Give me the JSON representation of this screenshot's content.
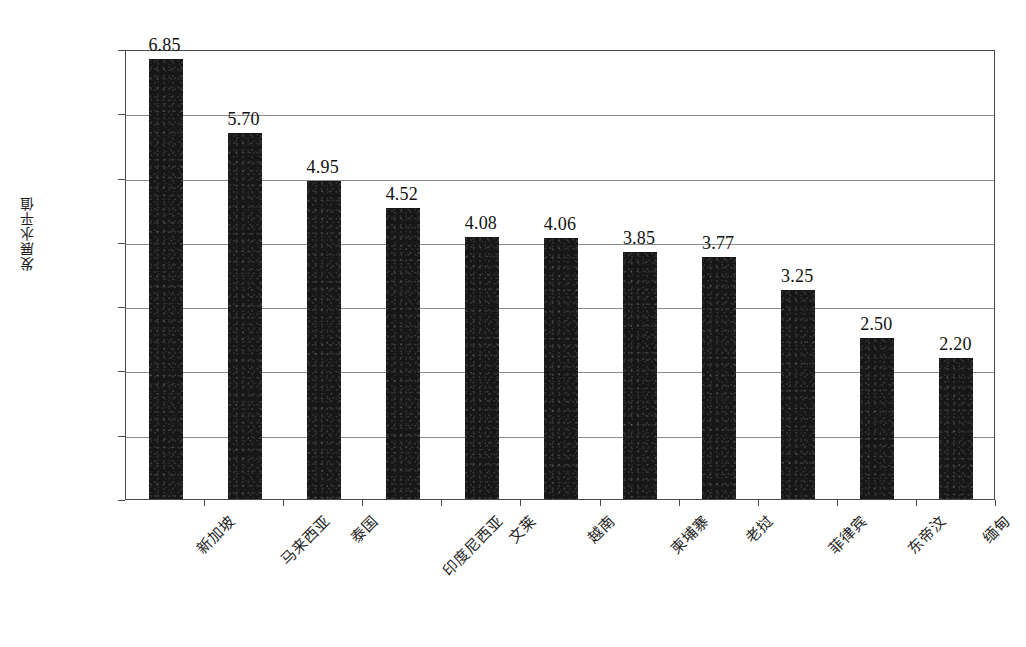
{
  "chart_data": {
    "type": "bar",
    "title": "",
    "subtitle": "",
    "xlabel": "",
    "ylabel": "发展水平值",
    "ylim": [
      0,
      7
    ],
    "ytick_labels": [
      "7.00",
      "6.00",
      "5.00",
      "4.00",
      "3.00",
      "2.00",
      "1.00",
      "0"
    ],
    "ytick_values": [
      7,
      6,
      5,
      4,
      3,
      2,
      1,
      0
    ],
    "grid": "horizontal",
    "legend": "none",
    "orientation": "vertical",
    "categories": [
      "新加坡",
      "马来西亚",
      "泰国",
      "印度尼西亚",
      "文莱",
      "越南",
      "柬埔寨",
      "老挝",
      "菲律宾",
      "东帝汶",
      "缅甸"
    ],
    "values": [
      6.85,
      5.7,
      4.95,
      4.52,
      4.08,
      4.06,
      3.85,
      3.77,
      3.25,
      2.5,
      2.2
    ],
    "data_labels": [
      "6.85",
      "5.70",
      "4.95",
      "4.52",
      "4.08",
      "4.06",
      "3.85",
      "3.77",
      "3.25",
      "2.50",
      "2.20"
    ],
    "series": [
      {
        "name": "发展水平值",
        "values": [
          6.85,
          5.7,
          4.95,
          4.52,
          4.08,
          4.06,
          3.85,
          3.77,
          3.25,
          2.5,
          2.2
        ]
      }
    ],
    "colors": {
      "bar": "#171717",
      "gridline": "#8c8c8c",
      "axis": "#4a4a4a",
      "text": "#111111",
      "background": "#ffffff"
    }
  }
}
